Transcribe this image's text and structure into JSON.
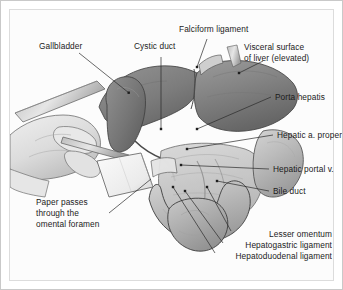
{
  "figure": {
    "background_color": "#fcfcfc",
    "border_color": "#c9c9c9",
    "inner_frame_color": "#dcdcdc",
    "label_color": "#1b1b1b",
    "leader_color": "#2a2a2a"
  },
  "labels": {
    "gallbladder": "Gallbladder",
    "cystic_duct": "Cystic duct",
    "falciform_ligament": "Falciform ligament",
    "visceral_surface_line1": "Visceral surface",
    "visceral_surface_line2": "of liver (elevated)",
    "porta_hepatis": "Porta hepatis",
    "hepatic_a_proper": "Hepatic a. proper",
    "hepatic_portal_v": "Hepatic portal v.",
    "bile_duct": "Bile duct",
    "lesser_omentum": "Lesser omentum",
    "hepatogastric_ligament": "Hepatogastric ligament",
    "hepatoduodenal_ligament": "Hepatoduodenal ligament",
    "paper_line1": "Paper passes",
    "paper_line2": "through the",
    "paper_line3": "omental foramen"
  },
  "anatomy_structures": {
    "liver": "visceral surface of liver, elevated",
    "gallbladder": "gallbladder fundus and body",
    "duodenum": "superior part of duodenum",
    "stomach": "pyloric region of stomach",
    "lesser_omentum": "lesser omentum membrane",
    "hand": "examiner hand holding paper strip",
    "paper_strip": "paper passed through omental foramen"
  },
  "palette": {
    "liver_dark": "#6f6f6f",
    "liver_mid": "#878787",
    "liver_light": "#9d9d9d",
    "gallbladder": "#7d7d7d",
    "omentum": "#c9c9c9",
    "viscera": "#b4b4b4",
    "skin": "#e3e3e3",
    "skin_shadow": "#bfbfbf",
    "paper": "#f4f4f4",
    "outline": "#3a3a3a"
  }
}
